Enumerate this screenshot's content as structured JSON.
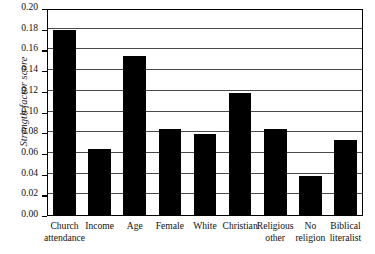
{
  "chart_data": {
    "type": "bar",
    "title": "",
    "xlabel": "",
    "ylabel": "Strength factor score",
    "ylim": [
      0.0,
      0.2
    ],
    "ytick_labels": [
      "0.20",
      "0.18",
      "0.16",
      "0.14",
      "0.12",
      "0.10",
      "0.08",
      "0.06",
      "0.04",
      "0.02",
      "0.00"
    ],
    "ytick_values": [
      0.2,
      0.18,
      0.16,
      0.14,
      0.12,
      0.1,
      0.08,
      0.06,
      0.04,
      0.02,
      0.0
    ],
    "grid": true,
    "legend": "none",
    "bar_color": "#000000",
    "categories": [
      "Church attendance",
      "Income",
      "Age",
      "Female",
      "White",
      "Christian",
      "Religious other",
      "No religion",
      "Biblical literalist"
    ],
    "category_lines": [
      [
        "Church",
        "attendance"
      ],
      [
        "Income",
        ""
      ],
      [
        "Age",
        ""
      ],
      [
        "Female",
        ""
      ],
      [
        "White",
        ""
      ],
      [
        "Christian",
        ""
      ],
      [
        "Religious",
        "other"
      ],
      [
        "No",
        "religion"
      ],
      [
        "Biblical",
        "literalist"
      ]
    ],
    "values": [
      0.18,
      0.0645,
      0.1545,
      0.0845,
      0.079,
      0.119,
      0.084,
      0.0385,
      0.073
    ]
  }
}
